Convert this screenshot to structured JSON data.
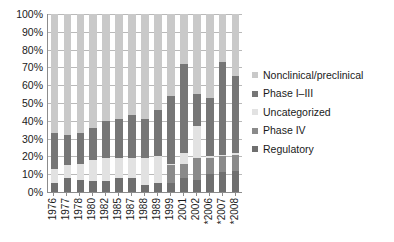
{
  "chart_data": {
    "type": "bar",
    "stacked": true,
    "normalized": true,
    "title": "",
    "xlabel": "",
    "ylabel": "",
    "ylim": [
      0,
      100
    ],
    "yticks": [
      0,
      10,
      20,
      30,
      40,
      50,
      60,
      70,
      80,
      90,
      100
    ],
    "ytick_labels": [
      "0%",
      "10%",
      "20%",
      "30%",
      "40%",
      "50%",
      "60%",
      "70%",
      "80%",
      "90%",
      "100%"
    ],
    "grid": true,
    "legend_position": "right",
    "categories": [
      "1976",
      "1977",
      "1978",
      "1980",
      "1982",
      "1985",
      "1987",
      "1988",
      "1989",
      "1999",
      "2001",
      "2002",
      "*2006",
      "*2007",
      "*2008"
    ],
    "series": [
      {
        "name": "Regulatory",
        "color": "#6f6f6f",
        "values": [
          5,
          8,
          7,
          6,
          6,
          8,
          8,
          4,
          5,
          5,
          8,
          7,
          10,
          11,
          12
        ]
      },
      {
        "name": "Phase IV",
        "color": "#8a8a8a",
        "values": [
          0,
          0,
          0,
          0,
          0,
          0,
          0,
          0,
          0,
          10,
          8,
          12,
          9,
          9,
          9
        ]
      },
      {
        "name": "Uncategorized",
        "color": "#e2e2e2",
        "values": [
          8,
          7,
          9,
          12,
          13,
          11,
          11,
          15,
          15,
          1,
          6,
          18,
          1,
          1,
          1
        ]
      },
      {
        "name": "Phase I–III",
        "color": "#767676",
        "values": [
          20,
          17,
          17,
          18,
          21,
          22,
          24,
          22,
          26,
          38,
          50,
          18,
          33,
          52,
          43
        ]
      },
      {
        "name": "Nonclinical/preclinical",
        "color": "#c9c9c9",
        "values": [
          67,
          68,
          67,
          64,
          60,
          59,
          57,
          59,
          54,
          46,
          28,
          45,
          47,
          27,
          35
        ]
      }
    ]
  },
  "legend": {
    "items": [
      {
        "label": "Nonclinical/preclinical",
        "color": "#c9c9c9"
      },
      {
        "label": "Phase I–III",
        "color": "#767676"
      },
      {
        "label": "Uncategorized",
        "color": "#e2e2e2"
      },
      {
        "label": "Phase IV",
        "color": "#8a8a8a"
      },
      {
        "label": "Regulatory",
        "color": "#6f6f6f"
      }
    ]
  },
  "axis": {
    "axis_line_color": "#8c8c8c",
    "gridline_color": "#b9b9b9"
  }
}
